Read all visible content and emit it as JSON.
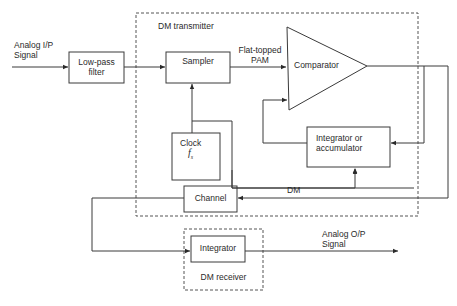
{
  "diagram": {
    "type": "block-diagram",
    "groups": {
      "transmitter": "DM transmitter",
      "receiver": "DM receiver"
    },
    "blocks": {
      "lpf": "Low-pass\nfilter",
      "lpf_line1": "Low-pass",
      "lpf_line2": "filter",
      "sampler": "Sampler",
      "comparator": "Comparator",
      "clock_line1": "Clock",
      "clock_line2": "f",
      "clock_sub": "s",
      "integrator_tx_line1": "Integrator or",
      "integrator_tx_line2": "accumulator",
      "channel": "Channel",
      "integrator_rx": "Integrator"
    },
    "signals": {
      "input_line1": "Analog I/P",
      "input_line2": "Signal",
      "pam_line1": "Flat-topped",
      "pam_line2": "PAM",
      "dm": "DM",
      "output_line1": "Analog O/P",
      "output_line2": "Signal"
    },
    "colors": {
      "line": "#3a3a3a",
      "dashed": "#555555",
      "text": "#2a2a2a"
    }
  }
}
